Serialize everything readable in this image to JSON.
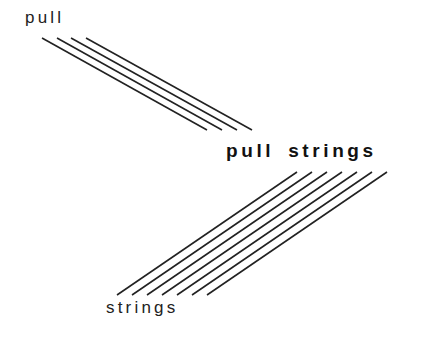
{
  "labels": {
    "top": "pull",
    "combined_word1": "pull",
    "combined_word2": "strings",
    "bottom": "strings"
  },
  "line_color": "#222222",
  "pull_lines": [
    {
      "x1": 42,
      "y1": 38,
      "x2": 207,
      "y2": 130
    },
    {
      "x1": 57,
      "y1": 38,
      "x2": 222,
      "y2": 130
    },
    {
      "x1": 71,
      "y1": 38,
      "x2": 237,
      "y2": 130
    },
    {
      "x1": 86,
      "y1": 38,
      "x2": 252,
      "y2": 130
    }
  ],
  "strings_lines": [
    {
      "x1": 117,
      "y1": 295,
      "x2": 297,
      "y2": 172
    },
    {
      "x1": 132,
      "y1": 295,
      "x2": 312,
      "y2": 172
    },
    {
      "x1": 147,
      "y1": 295,
      "x2": 327,
      "y2": 172
    },
    {
      "x1": 162,
      "y1": 295,
      "x2": 342,
      "y2": 172
    },
    {
      "x1": 177,
      "y1": 295,
      "x2": 357,
      "y2": 172
    },
    {
      "x1": 192,
      "y1": 295,
      "x2": 372,
      "y2": 172
    },
    {
      "x1": 207,
      "y1": 295,
      "x2": 387,
      "y2": 172
    }
  ]
}
